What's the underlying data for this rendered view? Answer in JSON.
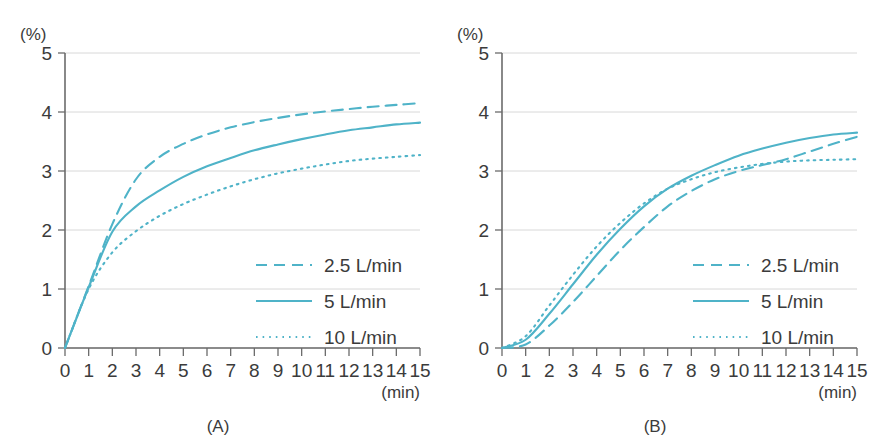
{
  "figure": {
    "panel_count": 2,
    "line_color": "#4fb3c8",
    "grid_color": "#d8d8d8",
    "axis_color": "#6b6b6b",
    "text_color": "#3b3b3b"
  },
  "panels": [
    {
      "caption": "(A)",
      "y_unit": "(%)",
      "x_unit": "(min)",
      "y_ticks": [
        "0",
        "1",
        "2",
        "3",
        "4",
        "5"
      ],
      "x_ticks": [
        "0",
        "1",
        "2",
        "3",
        "4",
        "5",
        "6",
        "7",
        "8",
        "9",
        "10",
        "11",
        "12",
        "13",
        "14",
        "15"
      ],
      "legend": [
        {
          "label": "2.5 L/min",
          "style": "dashed"
        },
        {
          "label": "5 L/min",
          "style": "solid"
        },
        {
          "label": "10 L/min",
          "style": "dotted"
        }
      ]
    },
    {
      "caption": "(B)",
      "y_unit": "(%)",
      "x_unit": "(min)",
      "y_ticks": [
        "0",
        "1",
        "2",
        "3",
        "4",
        "5"
      ],
      "x_ticks": [
        "0",
        "1",
        "2",
        "3",
        "4",
        "5",
        "6",
        "7",
        "8",
        "9",
        "10",
        "11",
        "12",
        "13",
        "14",
        "15"
      ],
      "legend": [
        {
          "label": "2.5 L/min",
          "style": "dashed"
        },
        {
          "label": "5 L/min",
          "style": "solid"
        },
        {
          "label": "10 L/min",
          "style": "dotted"
        }
      ]
    }
  ],
  "chart_data": [
    {
      "type": "line",
      "title": "(A)",
      "xlabel": "(min)",
      "ylabel": "(%)",
      "xlim": [
        0,
        15
      ],
      "ylim": [
        0,
        5
      ],
      "xticks": [
        0,
        1,
        2,
        3,
        4,
        5,
        6,
        7,
        8,
        9,
        10,
        11,
        12,
        13,
        14,
        15
      ],
      "yticks": [
        0,
        1,
        2,
        3,
        4,
        5
      ],
      "grid": true,
      "legend_position": "lower-right",
      "x": [
        0,
        1,
        2,
        3,
        4,
        5,
        6,
        7,
        8,
        9,
        10,
        11,
        12,
        13,
        14,
        15
      ],
      "series": [
        {
          "name": "2.5 L/min",
          "style": "dashed",
          "color": "#4fb3c8",
          "values": [
            0,
            1.05,
            2.1,
            2.86,
            3.24,
            3.46,
            3.62,
            3.74,
            3.83,
            3.9,
            3.96,
            4.01,
            4.05,
            4.09,
            4.12,
            4.15
          ]
        },
        {
          "name": "5 L/min",
          "style": "solid",
          "color": "#4fb3c8",
          "values": [
            0,
            1.03,
            1.97,
            2.4,
            2.67,
            2.9,
            3.08,
            3.22,
            3.35,
            3.45,
            3.54,
            3.62,
            3.69,
            3.74,
            3.79,
            3.82
          ]
        },
        {
          "name": "10 L/min",
          "style": "dotted",
          "color": "#4fb3c8",
          "values": [
            0,
            1.0,
            1.62,
            1.98,
            2.24,
            2.44,
            2.6,
            2.74,
            2.86,
            2.96,
            3.04,
            3.11,
            3.17,
            3.21,
            3.24,
            3.27
          ]
        }
      ]
    },
    {
      "type": "line",
      "title": "(B)",
      "xlabel": "(min)",
      "ylabel": "(%)",
      "xlim": [
        0,
        15
      ],
      "ylim": [
        0,
        5
      ],
      "xticks": [
        0,
        1,
        2,
        3,
        4,
        5,
        6,
        7,
        8,
        9,
        10,
        11,
        12,
        13,
        14,
        15
      ],
      "yticks": [
        0,
        1,
        2,
        3,
        4,
        5
      ],
      "grid": true,
      "legend_position": "lower-right",
      "x": [
        0,
        1,
        2,
        3,
        4,
        5,
        6,
        7,
        8,
        9,
        10,
        11,
        12,
        13,
        14,
        15
      ],
      "series": [
        {
          "name": "2.5 L/min",
          "style": "dashed",
          "color": "#4fb3c8",
          "values": [
            0,
            0.06,
            0.38,
            0.78,
            1.22,
            1.66,
            2.05,
            2.4,
            2.66,
            2.86,
            3.0,
            3.1,
            3.2,
            3.33,
            3.46,
            3.58
          ]
        },
        {
          "name": "5 L/min",
          "style": "solid",
          "color": "#4fb3c8",
          "values": [
            0,
            0.14,
            0.58,
            1.08,
            1.58,
            2.02,
            2.4,
            2.7,
            2.92,
            3.1,
            3.26,
            3.38,
            3.48,
            3.56,
            3.62,
            3.65
          ]
        },
        {
          "name": "10 L/min",
          "style": "dotted",
          "color": "#4fb3c8",
          "values": [
            0,
            0.2,
            0.72,
            1.24,
            1.72,
            2.12,
            2.45,
            2.7,
            2.86,
            2.98,
            3.06,
            3.12,
            3.16,
            3.18,
            3.19,
            3.2
          ]
        }
      ]
    }
  ]
}
